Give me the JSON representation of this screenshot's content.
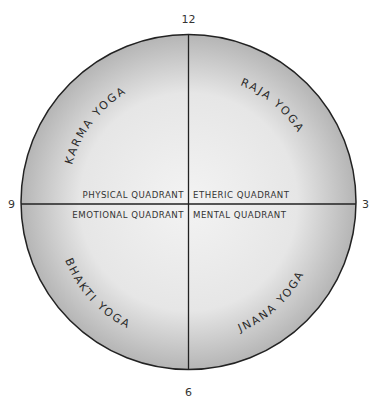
{
  "diagram": {
    "clock_labels": {
      "top": "12",
      "right": "3",
      "bottom": "6",
      "left": "9"
    },
    "quadrants": {
      "top_left": "PHYSICAL QUADRANT",
      "top_right": "ETHERIC QUADRANT",
      "bottom_left": "EMOTIONAL QUADRANT",
      "bottom_right": "MENTAL QUADRANT"
    },
    "yogas": {
      "top_left": "KARMA YOGA",
      "top_right": "RAJA YOGA",
      "bottom_left": "BHAKTI YOGA",
      "bottom_right": "JNANA YOGA"
    },
    "colors": {
      "outline": "#222222",
      "fill_center": "#f2f2f2",
      "fill_edge": "#b8b8b8"
    }
  }
}
